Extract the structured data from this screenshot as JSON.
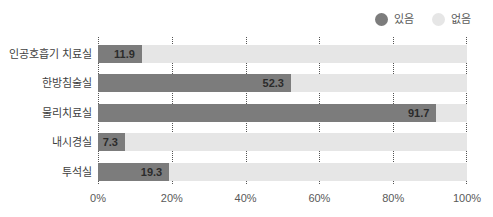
{
  "legend": {
    "position": "top-right",
    "items": [
      {
        "label": "있음",
        "color": "#7c7c7c",
        "icon": "circle-icon"
      },
      {
        "label": "없음",
        "color": "#e6e6e6",
        "icon": "circle-icon"
      }
    ]
  },
  "axis": {
    "x_ticks": [
      "0%",
      "20%",
      "40%",
      "60%",
      "80%",
      "100%"
    ]
  },
  "colors": {
    "yes": "#7c7c7c",
    "no": "#e6e6e6",
    "gridline": "#555555",
    "text": "#3f3f3f",
    "background": "#ffffff"
  },
  "chart_data": {
    "type": "bar",
    "orientation": "horizontal",
    "stacked": true,
    "title": "",
    "xlabel": "",
    "ylabel": "",
    "xlim": [
      0,
      100
    ],
    "xtick_values": [
      0,
      20,
      40,
      60,
      80,
      100
    ],
    "xtick_labels": [
      "0%",
      "20%",
      "40%",
      "60%",
      "80%",
      "100%"
    ],
    "grid": true,
    "grid_style": "dotted-vertical",
    "legend_position": "top-right",
    "categories": [
      "인공호흡기 치료실",
      "한방침술실",
      "물리치료실",
      "내시경실",
      "투석실"
    ],
    "series": [
      {
        "name": "있음",
        "color": "#7c7c7c",
        "values": [
          11.9,
          52.3,
          91.7,
          7.3,
          19.3
        ],
        "labels": [
          "11.9",
          "52.3",
          "91.7",
          "7.3",
          "19.3"
        ]
      },
      {
        "name": "없음",
        "color": "#e6e6e6",
        "values": [
          88.1,
          47.7,
          8.3,
          92.7,
          80.7
        ],
        "labels": [
          "",
          "",
          "",
          "",
          ""
        ]
      }
    ]
  }
}
